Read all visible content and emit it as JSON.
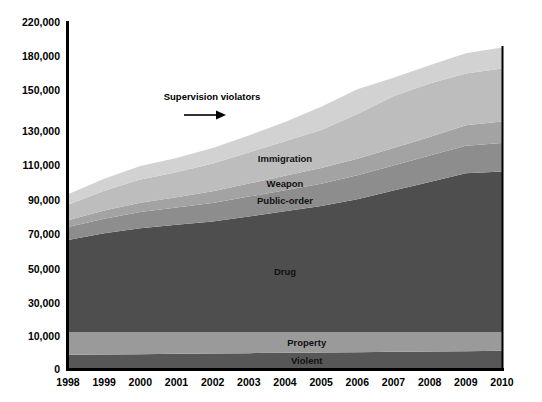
{
  "chart_data": {
    "type": "area",
    "stacked": true,
    "title": "",
    "subtitle": "",
    "xlabel": "",
    "ylabel": "",
    "grid": false,
    "legend_position": "inline-labels",
    "categories": [
      "1998",
      "1999",
      "2000",
      "2001",
      "2002",
      "2003",
      "2004",
      "2005",
      "2006",
      "2007",
      "2008",
      "2009",
      "2010"
    ],
    "x": [
      1998,
      1999,
      2000,
      2001,
      2002,
      2003,
      2004,
      2005,
      2006,
      2007,
      2008,
      2009,
      2010
    ],
    "ylim": [
      0,
      220000
    ],
    "ytick_labels": [
      "0",
      "10,000",
      "30,000",
      "50,000",
      "70,000",
      "90,000",
      "110,000",
      "130,000",
      "150,000",
      "180,000",
      "220,000"
    ],
    "ytick_values": [
      0,
      10000,
      30000,
      50000,
      70000,
      90000,
      110000,
      130000,
      150000,
      180000,
      220000
    ],
    "axis_scale": "non-uniform (compressed above 150,000)",
    "series": [
      {
        "name": "Violent",
        "label": "Violent",
        "color": "#575757",
        "values": [
          4300,
          4400,
          4500,
          4600,
          4700,
          4800,
          4900,
          5000,
          5100,
          5200,
          5300,
          5400,
          5500
        ]
      },
      {
        "name": "Property",
        "label": "Property",
        "color": "#9a9a9a",
        "values": [
          8200,
          8000,
          7900,
          7700,
          7500,
          7400,
          7300,
          7200,
          7100,
          7000,
          6900,
          6800,
          6700
        ]
      },
      {
        "name": "Drug",
        "label": "Drug",
        "color": "#4e4e4e",
        "values": [
          54000,
          58000,
          61000,
          63000,
          65000,
          68000,
          71000,
          74000,
          78000,
          83000,
          88000,
          93000,
          94000
        ]
      },
      {
        "name": "Public-order",
        "label": "Public-order",
        "color": "#8d8d8d",
        "values": [
          7500,
          8500,
          9300,
          10000,
          10800,
          11500,
          12200,
          13000,
          13800,
          14500,
          15300,
          16000,
          16500
        ]
      },
      {
        "name": "Weapon",
        "label": "Weapon",
        "color": "#a3a3a3",
        "values": [
          4000,
          4700,
          5400,
          6000,
          6800,
          7600,
          8300,
          9000,
          9600,
          10200,
          10800,
          11400,
          11800
        ]
      },
      {
        "name": "Immigration",
        "label": "Immigration",
        "color": "#bdbdbd",
        "values": [
          9000,
          11500,
          13500,
          14500,
          16000,
          18000,
          20000,
          22000,
          24500,
          27000,
          29500,
          32000,
          34500
        ]
      },
      {
        "name": "Supervision violators",
        "label": "Supervision violators",
        "color": "#d2d2d2",
        "values": [
          6000,
          7000,
          7800,
          8200,
          9000,
          9800,
          10500,
          11500,
          12500,
          14000,
          16000,
          18500,
          21000
        ]
      }
    ],
    "annotation": {
      "text": "Supervision violators",
      "arrow": "right-arrow"
    }
  },
  "colors": {
    "background": "#ffffff",
    "axis": "#000000",
    "text": "#000000"
  }
}
